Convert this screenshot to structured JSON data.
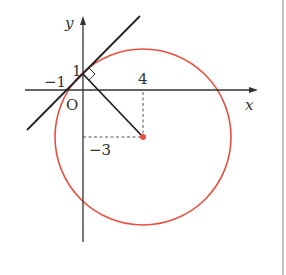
{
  "diagram": {
    "axes": {
      "x_label": "x",
      "y_label": "y",
      "origin_label": "O"
    },
    "tick_labels": {
      "y_intercept": "1",
      "x_intercept": "−1",
      "center_x": "4",
      "center_y": "−3"
    },
    "circle": {
      "center": [
        4,
        -3
      ],
      "color": "#e8503f"
    },
    "tangent_line": {
      "through": [
        [
          -1,
          0
        ],
        [
          0,
          1
        ]
      ],
      "color": "#222222"
    },
    "radius_segment": {
      "from": [
        0,
        1
      ],
      "to": [
        4,
        -3
      ]
    },
    "right_angle_marker": true
  }
}
